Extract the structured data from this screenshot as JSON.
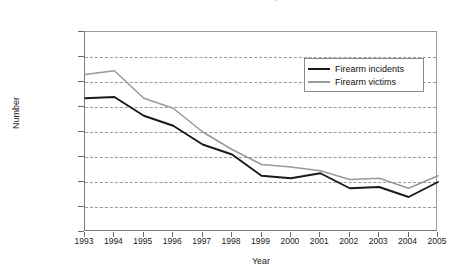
{
  "chart_data": {
    "type": "line",
    "title": "Firearm incidents and firearm victims, 1993-2005",
    "xlabel": "Year",
    "ylabel": "Number",
    "x": [
      1993,
      1994,
      1995,
      1996,
      1997,
      1998,
      1999,
      2000,
      2001,
      2002,
      2003,
      2004,
      2005
    ],
    "xtick_labels": [
      "1993",
      "1994",
      "1995",
      "1996",
      "1997",
      "1998",
      "1999",
      "2000",
      "2001",
      "2002",
      "2003",
      "2004",
      "2005"
    ],
    "ytick_labels": [
      "1,600,000",
      "1,400,000",
      "1,200,000",
      "1,000,000",
      "800,000",
      "600,000",
      "400,000",
      "200,000",
      "0"
    ],
    "ytick_values": [
      1600000,
      1400000,
      1200000,
      1000000,
      800000,
      600000,
      400000,
      200000,
      0
    ],
    "ylim": [
      0,
      1600000
    ],
    "grid": "horizontal-dashed",
    "legend_position": "upper-right-inside",
    "series": [
      {
        "name": "Firearm incidents",
        "color": "#1a1a1a",
        "values": [
          1070000,
          1080000,
          930000,
          850000,
          700000,
          620000,
          450000,
          430000,
          470000,
          350000,
          360000,
          280000,
          400000
        ]
      },
      {
        "name": "Firearm victims",
        "color": "#9a9a9a",
        "values": [
          1260000,
          1290000,
          1070000,
          990000,
          800000,
          660000,
          540000,
          520000,
          490000,
          420000,
          430000,
          350000,
          450000
        ]
      }
    ]
  }
}
